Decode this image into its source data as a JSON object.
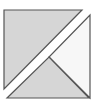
{
  "diagram": {
    "colors": {
      "background": "#ffffff",
      "gray_fill": "#d6d6d6",
      "light_fill": "#f7f7f7",
      "stroke": "#555555"
    },
    "pieces": [
      {
        "name": "upper-left-triangle",
        "fill": "gray",
        "points": "4,10 82,10 4,89"
      },
      {
        "name": "right-triangle",
        "fill": "light",
        "points": "90,15 90,98 49,57"
      },
      {
        "name": "bottom-triangle",
        "fill": "gray",
        "points": "7,98 89,98 49,57"
      }
    ]
  }
}
